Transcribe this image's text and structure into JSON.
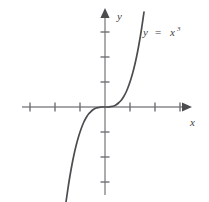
{
  "figure": {
    "name": "cubic-function-graph",
    "background_color": "#ffffff",
    "width": 209,
    "height": 202
  },
  "labels": {
    "x_axis_name": "x",
    "y_axis_name": "y",
    "equation_lhs": "y",
    "equation_operator": "=",
    "equation_base": "x",
    "equation_exponent": "3"
  },
  "colors": {
    "curve": "#4b4d50",
    "axis": "#87898b",
    "tick": "#6e7072",
    "arrow": "#4a4c4e",
    "text": "#3f4143"
  },
  "chart_data": {
    "type": "line",
    "title": "",
    "subtitle": "",
    "xlabel": "x",
    "ylabel": "y",
    "function": "y = x^3",
    "grid": false,
    "legend": false,
    "annotations": [
      {
        "text": "y = x³",
        "x_px": 145,
        "y_px": 32,
        "data_x": 1.6,
        "data_y": 3.0
      }
    ],
    "axes": {
      "origin_px": [
        105,
        107
      ],
      "pixels_per_unit_x": 25,
      "pixels_per_unit_y": 25,
      "xlim": [
        -3.3,
        3.4
      ],
      "ylim": [
        -3.8,
        3.9
      ],
      "x_axis_span_px": [
        22,
        190
      ],
      "y_axis_span_px": [
        10,
        195
      ],
      "x_arrow_direction": "right",
      "y_arrow_direction": "up",
      "x_ticks": [
        -3,
        -2,
        -1,
        1,
        2,
        3
      ],
      "y_ticks": [
        -3,
        -2,
        -1,
        1,
        2,
        3
      ],
      "x_tick_labels": [
        "",
        "",
        "",
        "",
        "",
        ""
      ],
      "y_tick_labels": [
        "",
        "",
        "",
        "",
        "",
        ""
      ],
      "tick_half_length_px": 4.5
    },
    "series": [
      {
        "name": "y = x^3",
        "color": "#4b4d50",
        "x": [
          -1.56,
          -1.45,
          -1.35,
          -1.25,
          -1.15,
          -1.05,
          -0.95,
          -0.85,
          -0.75,
          -0.65,
          -0.55,
          -0.45,
          -0.35,
          -0.25,
          -0.15,
          -0.05,
          0.05,
          0.15,
          0.25,
          0.35,
          0.45,
          0.55,
          0.65,
          0.75,
          0.85,
          0.95,
          1.05,
          1.15,
          1.25,
          1.35,
          1.45,
          1.56
        ],
        "y": [
          -3.8,
          -3.05,
          -2.46,
          -1.95,
          -1.52,
          -1.16,
          -0.86,
          -0.61,
          -0.42,
          -0.27,
          -0.17,
          -0.09,
          -0.04,
          -0.02,
          0.0,
          0.0,
          0.0,
          0.0,
          0.02,
          0.04,
          0.09,
          0.17,
          0.27,
          0.42,
          0.61,
          0.86,
          1.16,
          1.52,
          1.95,
          2.46,
          3.05,
          3.8
        ]
      }
    ]
  }
}
